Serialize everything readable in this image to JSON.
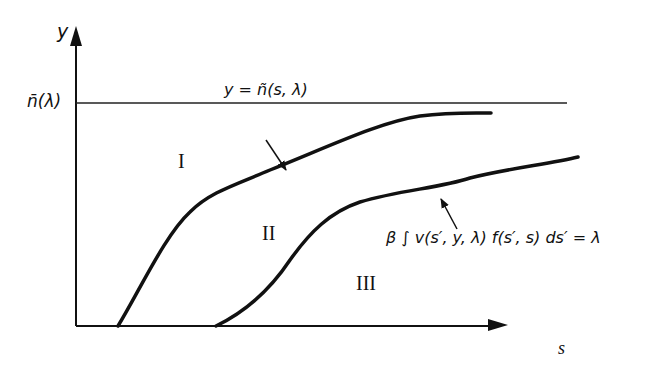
{
  "diagram": {
    "axes": {
      "y_label": "y",
      "x_label": "s",
      "asymptote_label": "n̄(λ)"
    },
    "curves": [
      {
        "name": "upper-curve",
        "label": "y = ñ(s, λ)"
      },
      {
        "name": "lower-curve",
        "label": "β ∫ v(s′, y, λ) f(s′, s) ds′ = λ"
      }
    ],
    "regions": [
      {
        "name": "region-1",
        "label": "I"
      },
      {
        "name": "region-2",
        "label": "II"
      },
      {
        "name": "region-3",
        "label": "III"
      }
    ],
    "colors": {
      "ink": "#111111",
      "background": "#ffffff"
    }
  }
}
